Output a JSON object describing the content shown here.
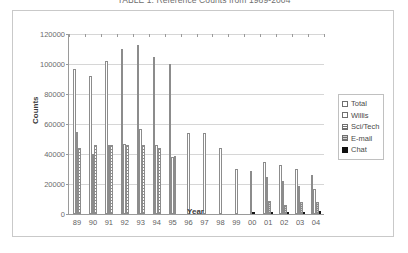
{
  "chart_data": {
    "type": "bar",
    "title": "TABLE 1: Reference Counts from 1989-2004",
    "xlabel": "Year",
    "ylabel": "Counts",
    "ylim": [
      0,
      120000
    ],
    "ytick_step": 20000,
    "yticks": [
      "0",
      "20000",
      "40000",
      "60000",
      "80000",
      "100000",
      "120000"
    ],
    "grid": true,
    "legend_position": "right",
    "categories": [
      "89",
      "90",
      "91",
      "92",
      "93",
      "94",
      "95",
      "96",
      "97",
      "98",
      "99",
      "00",
      "01",
      "02",
      "03",
      "04"
    ],
    "series": [
      {
        "name": "Total",
        "values": [
          97000,
          92000,
          102000,
          110000,
          113000,
          105000,
          100000,
          54000,
          54000,
          44000,
          30000,
          29000,
          35000,
          33000,
          30000,
          26000
        ]
      },
      {
        "name": "Willis",
        "values": [
          55000,
          40000,
          46000,
          47000,
          57000,
          46000,
          38000,
          0,
          0,
          0,
          0,
          0,
          25000,
          22000,
          19000,
          17000
        ]
      },
      {
        "name": "Sci/Tech",
        "values": [
          44000,
          46000,
          46000,
          46000,
          46000,
          44000,
          39000,
          0,
          0,
          0,
          0,
          0,
          0,
          0,
          0,
          0
        ]
      },
      {
        "name": "E-mail",
        "values": [
          0,
          0,
          0,
          0,
          0,
          0,
          0,
          0,
          0,
          0,
          0,
          0,
          9000,
          6000,
          8000,
          8000
        ]
      },
      {
        "name": "Chat",
        "values": [
          0,
          0,
          0,
          0,
          0,
          0,
          0,
          0,
          0,
          0,
          0,
          1200,
          1500,
          1200,
          1500,
          1800
        ]
      }
    ]
  }
}
